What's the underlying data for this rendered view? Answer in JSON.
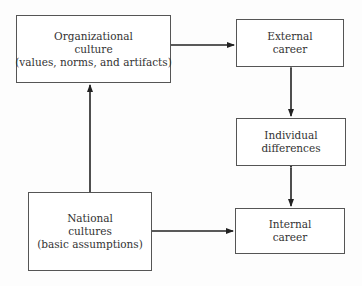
{
  "diagram": {
    "nodes": [
      {
        "id": "org_culture",
        "lines": [
          "Organizational",
          "culture",
          "(values, norms, and artifacts)"
        ]
      },
      {
        "id": "external_career",
        "lines": [
          "External",
          "career"
        ]
      },
      {
        "id": "individual_differences",
        "lines": [
          "Individual",
          "differences"
        ]
      },
      {
        "id": "national_cultures",
        "lines": [
          "National",
          "cultures",
          "(basic assumptions)"
        ]
      },
      {
        "id": "internal_career",
        "lines": [
          "Internal",
          "career"
        ]
      }
    ],
    "edges": [
      {
        "from": "national_cultures",
        "to": "org_culture",
        "direction": "one-way"
      },
      {
        "from": "org_culture",
        "to": "external_career",
        "direction": "one-way"
      },
      {
        "from": "national_cultures",
        "to": "internal_career",
        "direction": "one-way"
      },
      {
        "from": "external_career",
        "to": "individual_differences",
        "direction": "two-way"
      },
      {
        "from": "individual_differences",
        "to": "internal_career",
        "direction": "two-way"
      }
    ]
  }
}
